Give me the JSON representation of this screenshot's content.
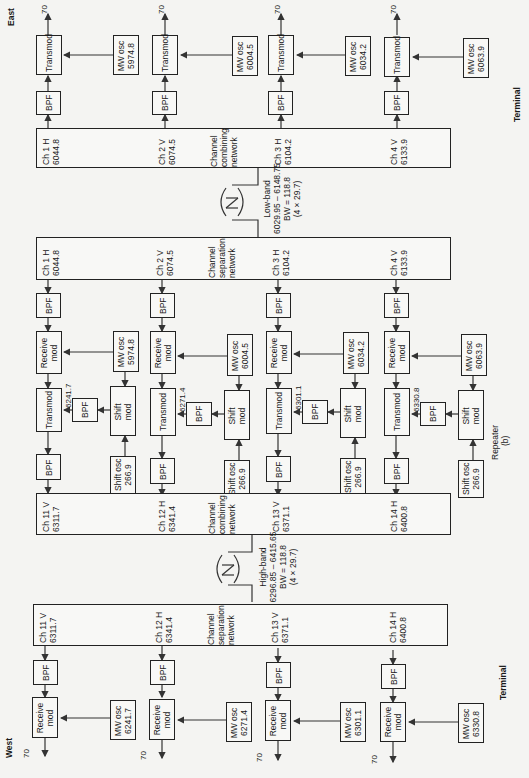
{
  "labels": {
    "east": "East",
    "west": "West",
    "terminal_top": "Terminal",
    "terminal_bottom": "Terminal",
    "repeater": "Repeater",
    "figure": "(b)"
  },
  "east_terminal": {
    "channels": [
      {
        "ch": "Ch 1 H",
        "freq": "6044.8",
        "mw_osc": "MW osc",
        "mw_freq": "5974.8",
        "mod": "Transmod",
        "bpf": "BPF",
        "if": "70"
      },
      {
        "ch": "Ch 2 V",
        "freq": "6074.5",
        "mw_osc": "MW osc",
        "mw_freq": "6004.5",
        "mod": "Transmod",
        "bpf": "BPF",
        "if": "70"
      },
      {
        "ch": "Ch 3 H",
        "freq": "6104.2",
        "mw_osc": "MW osc",
        "mw_freq": "6034.2",
        "mod": "Transmod",
        "bpf": "BPF",
        "if": "70"
      },
      {
        "ch": "Ch 4 V",
        "freq": "6133.9",
        "mw_osc": "MW osc",
        "mw_freq": "6063.9",
        "mod": "Transmod",
        "bpf": "BPF",
        "if": "70"
      }
    ],
    "network_line1": "Channel",
    "network_line2": "combining",
    "network_line3": "network"
  },
  "low_band": {
    "line1": "Low-band",
    "line2": "6029.95 – 6148.75",
    "line3": "BW = 118.8",
    "line4": "(4 × 29.7)"
  },
  "repeater": {
    "low_network": {
      "line1": "Channel",
      "line2": "separation",
      "line3": "network",
      "channels": [
        {
          "ch": "Ch 1 H",
          "freq": "6044.8"
        },
        {
          "ch": "Ch 2 V",
          "freq": "6074.5"
        },
        {
          "ch": "Ch 3 H",
          "freq": "6104.2"
        },
        {
          "ch": "Ch 4 V",
          "freq": "6133.9"
        }
      ]
    },
    "chains": [
      {
        "bpf_in": "BPF",
        "rx": "Receive",
        "rx2": "mod",
        "mw_osc": "MW osc",
        "mw_freq": "5974.8",
        "tx": "Transmod",
        "tx_freq": "6241.7",
        "bpf_mid": "BPF",
        "shift": "Shift",
        "shift2": "mod",
        "shift_osc": "Shift osc",
        "shift_freq": "266.9",
        "bpf_out": "BPF"
      },
      {
        "bpf_in": "BPF",
        "rx": "Receive",
        "rx2": "mod",
        "mw_osc": "MW osc",
        "mw_freq": "6004.5",
        "tx": "Transmod",
        "tx_freq": "6271.4",
        "bpf_mid": "BPF",
        "shift": "Shift",
        "shift2": "mod",
        "shift_osc": "Shift osc",
        "shift_freq": "266.9",
        "bpf_out": "BPF"
      },
      {
        "bpf_in": "BPF",
        "rx": "Receive",
        "rx2": "mod",
        "mw_osc": "MW osc",
        "mw_freq": "6034.2",
        "tx": "Transmod",
        "tx_freq": "6301.1",
        "bpf_mid": "BPF",
        "shift": "Shift",
        "shift2": "mod",
        "shift_osc": "Shift osc",
        "shift_freq": "266.9",
        "bpf_out": "BPF"
      },
      {
        "bpf_in": "BPF",
        "rx": "Receive",
        "rx2": "mod",
        "mw_osc": "MW osc",
        "mw_freq": "6063.9",
        "tx": "Transmod",
        "tx_freq": "6330.8",
        "bpf_mid": "BPF",
        "shift": "Shift",
        "shift2": "mod",
        "shift_osc": "Shift osc",
        "shift_freq": "266.9",
        "bpf_out": "BPF"
      }
    ],
    "high_network": {
      "line1": "Channel",
      "line2": "combining",
      "line3": "network",
      "channels": [
        {
          "ch": "Ch 11 V",
          "freq": "6311.7"
        },
        {
          "ch": "Ch 12 H",
          "freq": "6341.4"
        },
        {
          "ch": "Ch 13 V",
          "freq": "6371.1"
        },
        {
          "ch": "Ch 14 H",
          "freq": "6400.8"
        }
      ]
    }
  },
  "high_band": {
    "line1": "High-band",
    "line2": "6296.85 – 6415.65",
    "line3": "BW = 118.8",
    "line4": "(4 × 29.7)"
  },
  "west_terminal": {
    "network_line1": "Channel",
    "network_line2": "separation",
    "network_line3": "network",
    "channels": [
      {
        "ch": "Ch 11 V",
        "freq": "6311.7",
        "bpf": "BPF",
        "rx": "Receive",
        "rx2": "mod",
        "mw_osc": "MW osc",
        "mw_freq": "6241.7",
        "if": "70"
      },
      {
        "ch": "Ch 12 H",
        "freq": "6341.4",
        "bpf": "BPF",
        "rx": "Receive",
        "rx2": "mod",
        "mw_osc": "MW osc",
        "mw_freq": "6271.4",
        "if": "70"
      },
      {
        "ch": "Ch 13 V",
        "freq": "6371.1",
        "bpf": "BPF",
        "rx": "Receive",
        "rx2": "mod",
        "mw_osc": "MW osc",
        "mw_freq": "6301.1",
        "if": "70"
      },
      {
        "ch": "Ch 14 H",
        "freq": "6400.8",
        "bpf": "BPF",
        "rx": "Receive",
        "rx2": "mod",
        "mw_osc": "MW osc",
        "mw_freq": "6330.8",
        "if": "70"
      }
    ]
  }
}
